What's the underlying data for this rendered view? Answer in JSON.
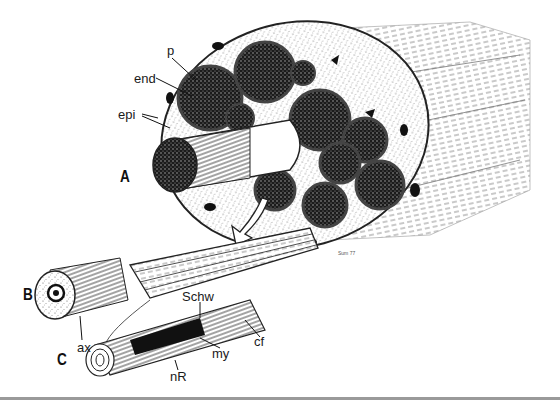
{
  "figure": {
    "panels": [
      {
        "id": "A",
        "label": "A"
      },
      {
        "id": "B",
        "label": "B"
      },
      {
        "id": "C",
        "label": "C"
      }
    ],
    "labels": {
      "p": "p",
      "end": "end",
      "epi": "epi",
      "ax": "ax",
      "schw": "Schw",
      "cf": "cf",
      "my": "my",
      "nr": "nR"
    },
    "signature": "Sum 77",
    "colors": {
      "ink": "#111111",
      "background": "#ffffff",
      "rule": "#9a9a9a",
      "stipple": "#555555"
    }
  }
}
